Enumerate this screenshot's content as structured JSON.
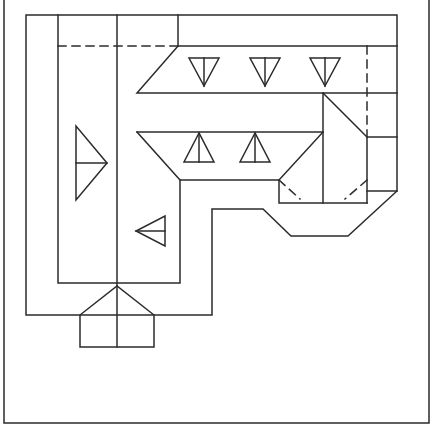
{
  "diagram": {
    "type": "roof-plan",
    "stroke_color": "#2b2b2b",
    "background": "#ffffff",
    "stroke_width": 1.5,
    "frame": {
      "x1": 4,
      "x2": 429,
      "y_bottom": 423
    },
    "solid_paths": [
      {
        "name": "roof-outline-main",
        "points": [
          [
            26,
            15
          ],
          [
            397,
            15
          ],
          [
            397,
            191
          ],
          [
            348,
            236
          ],
          [
            291,
            236
          ],
          [
            263,
            209
          ],
          [
            212,
            209
          ],
          [
            212,
            315
          ],
          [
            26,
            315
          ],
          [
            26,
            15
          ]
        ]
      },
      {
        "name": "roof-inner-left-wing",
        "points": [
          [
            58,
            15
          ],
          [
            58,
            283
          ],
          [
            180,
            283
          ],
          [
            180,
            180
          ]
        ]
      },
      {
        "name": "ridge-vertical-center",
        "points": [
          [
            117,
            15
          ],
          [
            117,
            347
          ]
        ]
      },
      {
        "name": "upper-wing-top-step",
        "points": [
          [
            178,
            15
          ],
          [
            178,
            46
          ],
          [
            397,
            46
          ]
        ]
      },
      {
        "name": "upper-wing-hip",
        "points": [
          [
            178,
            46
          ],
          [
            137,
            93
          ],
          [
            397,
            93
          ]
        ]
      },
      {
        "name": "lower-wing-hip",
        "points": [
          [
            137,
            132
          ],
          [
            323,
            132
          ]
        ]
      },
      {
        "name": "lower-wing-left-hip",
        "points": [
          [
            137,
            132
          ],
          [
            180,
            180
          ],
          [
            279,
            180
          ]
        ]
      },
      {
        "name": "dormer-left-hip",
        "points": [
          [
            323,
            132
          ],
          [
            279,
            180
          ],
          [
            279,
            203
          ],
          [
            367,
            203
          ]
        ]
      },
      {
        "name": "dormer-center-ridge",
        "points": [
          [
            323,
            93
          ],
          [
            323,
            203
          ]
        ]
      },
      {
        "name": "dormer-right-hip",
        "points": [
          [
            323,
            93
          ],
          [
            367,
            137
          ],
          [
            367,
            203
          ]
        ]
      },
      {
        "name": "east-wing-ledge-upper",
        "points": [
          [
            367,
            137
          ],
          [
            397,
            137
          ]
        ]
      },
      {
        "name": "east-wing-ledge-lower",
        "points": [
          [
            367,
            191
          ],
          [
            397,
            191
          ]
        ]
      },
      {
        "name": "porch-gable",
        "points": [
          [
            80,
            347
          ],
          [
            80,
            315
          ],
          [
            117,
            286
          ],
          [
            154,
            315
          ],
          [
            154,
            347
          ],
          [
            80,
            347
          ]
        ]
      }
    ],
    "dashed_paths": [
      {
        "name": "hidden-line-upper",
        "points": [
          [
            58,
            46
          ],
          [
            178,
            46
          ]
        ]
      },
      {
        "name": "hidden-line-east",
        "points": [
          [
            367,
            46
          ],
          [
            367,
            137
          ]
        ]
      },
      {
        "name": "hidden-valley-left",
        "points": [
          [
            279,
            180
          ],
          [
            300,
            199
          ]
        ]
      },
      {
        "name": "hidden-valley-right",
        "points": [
          [
            367,
            180
          ],
          [
            345,
            199
          ]
        ]
      }
    ],
    "slope_arrows": [
      {
        "name": "slope-arrow-down-1",
        "direction": "down",
        "cx": 204,
        "top": 58,
        "tip": 86,
        "half_width": 15
      },
      {
        "name": "slope-arrow-down-2",
        "direction": "down",
        "cx": 265,
        "top": 58,
        "tip": 86,
        "half_width": 15
      },
      {
        "name": "slope-arrow-down-3",
        "direction": "down",
        "cx": 325,
        "top": 58,
        "tip": 86,
        "half_width": 15
      },
      {
        "name": "slope-arrow-up-1",
        "direction": "up",
        "cx": 199,
        "top": 133,
        "tip": 162,
        "half_width": 15
      },
      {
        "name": "slope-arrow-up-2",
        "direction": "up",
        "cx": 255,
        "top": 133,
        "tip": 162,
        "half_width": 15
      },
      {
        "name": "slope-arrow-right-1",
        "direction": "right",
        "cy": 163,
        "base": 76,
        "tip": 107,
        "half_height": 37
      },
      {
        "name": "slope-arrow-left-1",
        "direction": "left",
        "cy": 231,
        "base": 165,
        "tip": 136,
        "half_height": 15
      }
    ]
  }
}
